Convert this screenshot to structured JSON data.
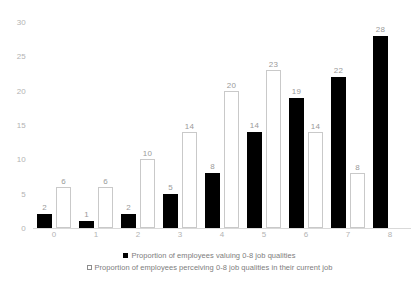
{
  "chart_data": {
    "type": "bar",
    "title": "",
    "xlabel": "",
    "ylabel": "",
    "ylim": [
      0,
      30
    ],
    "yticks": [
      0,
      5,
      10,
      15,
      20,
      25,
      30
    ],
    "grid": false,
    "legend_position": "bottom",
    "categories": [
      "0",
      "1",
      "2",
      "3",
      "4",
      "5",
      "6",
      "7",
      "8"
    ],
    "series": [
      {
        "name": "Proportion of employees valuing 0-8 job qualities",
        "style": "filled-black",
        "color": "#000000",
        "values": [
          2,
          1,
          2,
          5,
          8,
          14,
          19,
          22,
          28
        ]
      },
      {
        "name": "Proportion of employees perceiving 0-8 job qualities in their current job",
        "style": "hollow-outline",
        "color": "#ffffff",
        "border_color": "#c9c9c9",
        "values": [
          6,
          6,
          10,
          14,
          20,
          23,
          14,
          8,
          null
        ]
      }
    ]
  },
  "legend": {
    "items": [
      {
        "label": "Proportion of employees valuing 0-8 job qualities"
      },
      {
        "label": "Proportion of employees perceiving 0-8 job qualities in their current job"
      }
    ]
  }
}
